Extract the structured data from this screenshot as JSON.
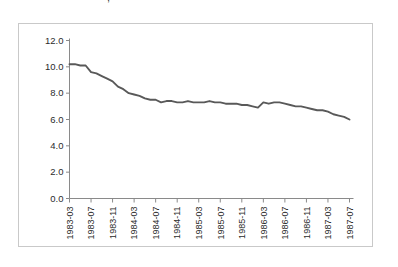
{
  "figure": {
    "title_clipped": "⚬⚬⚬ ⚬⚬⚬ ⚬⚬⚬⚬, ⚬⚬⚬⚬⚬ ⚬⚬⚬⚬⚬ ⚬ ⚬⚬⚬",
    "line_color": "#595959",
    "frame_color": "#c9c9c9",
    "axis_color": "#8a8a8a"
  },
  "chart_data": {
    "type": "line",
    "title": "",
    "xlabel": "",
    "ylabel": "",
    "ylim": [
      0.0,
      12.0
    ],
    "ytick_values": [
      0.0,
      2.0,
      4.0,
      6.0,
      8.0,
      10.0,
      12.0
    ],
    "ytick_labels": [
      "0.0",
      "2.0",
      "4.0",
      "6.0",
      "8.0",
      "10.0",
      "12.0"
    ],
    "grid": false,
    "legend": false,
    "xtick_labels": [
      "1983-03",
      "1983-07",
      "1983-11",
      "1984-03",
      "1984-07",
      "1984-11",
      "1985-03",
      "1985-07",
      "1985-11",
      "1986-03",
      "1986-07",
      "1986-11",
      "1987-03",
      "1987-07"
    ],
    "xtick_indices": [
      0,
      4,
      8,
      12,
      16,
      20,
      24,
      28,
      32,
      36,
      40,
      44,
      48,
      52
    ],
    "x": [
      "1983-03",
      "1983-04",
      "1983-05",
      "1983-06",
      "1983-07",
      "1983-08",
      "1983-09",
      "1983-10",
      "1983-11",
      "1983-12",
      "1984-01",
      "1984-02",
      "1984-03",
      "1984-04",
      "1984-05",
      "1984-06",
      "1984-07",
      "1984-08",
      "1984-09",
      "1984-10",
      "1984-11",
      "1984-12",
      "1985-01",
      "1985-02",
      "1985-03",
      "1985-04",
      "1985-05",
      "1985-06",
      "1985-07",
      "1985-08",
      "1985-09",
      "1985-10",
      "1985-11",
      "1985-12",
      "1986-01",
      "1986-02",
      "1986-03",
      "1986-04",
      "1986-05",
      "1986-06",
      "1986-07",
      "1986-08",
      "1986-09",
      "1986-10",
      "1986-11",
      "1986-12",
      "1987-01",
      "1987-02",
      "1987-03",
      "1987-04",
      "1987-05",
      "1987-06",
      "1987-07"
    ],
    "series": [
      {
        "name": "rate",
        "values": [
          10.2,
          10.2,
          10.1,
          10.1,
          9.6,
          9.5,
          9.3,
          9.1,
          8.9,
          8.5,
          8.3,
          8.0,
          7.9,
          7.8,
          7.6,
          7.5,
          7.5,
          7.3,
          7.4,
          7.4,
          7.3,
          7.3,
          7.4,
          7.3,
          7.3,
          7.3,
          7.4,
          7.3,
          7.3,
          7.2,
          7.2,
          7.2,
          7.1,
          7.1,
          7.0,
          6.9,
          7.3,
          7.2,
          7.3,
          7.3,
          7.2,
          7.1,
          7.0,
          7.0,
          6.9,
          6.8,
          6.7,
          6.7,
          6.6,
          6.4,
          6.3,
          6.2,
          6.0
        ]
      }
    ]
  }
}
